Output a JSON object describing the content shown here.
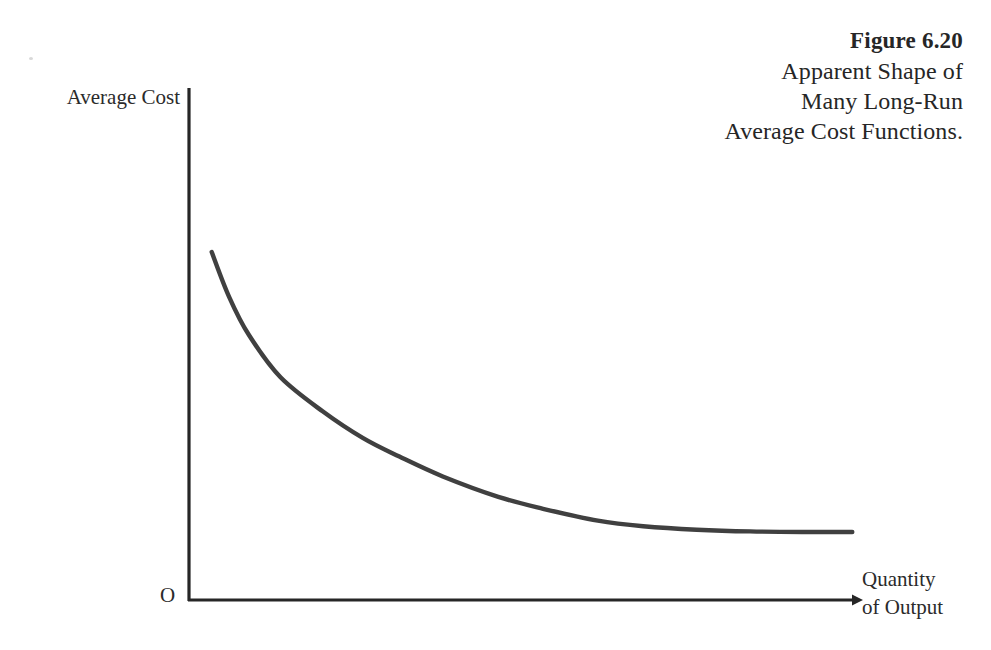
{
  "figure": {
    "caption_lines": [
      "Figure 6.20",
      "Apparent Shape of",
      "Many Long-Run",
      "Average Cost Functions."
    ],
    "caption_number": "Figure 6.20",
    "caption_line_2": "Apparent Shape of",
    "caption_line_3": "Many Long-Run",
    "caption_line_4": "Average Cost Functions.",
    "origin_label": "O",
    "y_axis_label": "Average Cost",
    "x_axis_label_line_1": "Quantity",
    "x_axis_label_line_2": "of Output"
  },
  "colors": {
    "background": "#ffffff",
    "curve": "#404040",
    "axis": "#262626",
    "text": "#2b2b2b"
  },
  "chart_data": {
    "type": "line",
    "title": "Apparent Shape of Many Long-Run Average Cost Functions.",
    "subtitle": "Figure 6.20",
    "xlabel": "Quantity of Output",
    "ylabel": "Average Cost",
    "grid": false,
    "legend": "none",
    "axis_style": "two-axis open (L-shaped), x-axis terminates in arrowhead",
    "origin_label": "O",
    "xlim": [
      0,
      100
    ],
    "ylim": [
      0,
      100
    ],
    "x_tick_labels": [],
    "y_tick_labels": [],
    "annotations": [],
    "series": [
      {
        "name": "Long-Run Average Cost",
        "description": "Monotonically decreasing convex curve that falls steeply at low output then flattens to a horizontal asymptote, illustrating economies of scale followed by constant returns.",
        "x": [
          3.4,
          6.0,
          9.0,
          13.7,
          20.0,
          26.0,
          31.5,
          38.0,
          46.3,
          53.0,
          61.2,
          68.0,
          76.0,
          84.0,
          92.0,
          99.3
        ],
        "y": [
          67.9,
          60.0,
          53.2,
          45.8,
          39.8,
          35.1,
          31.8,
          28.3,
          24.7,
          22.6,
          20.5,
          19.5,
          18.9,
          18.6,
          18.5,
          18.5
        ]
      }
    ]
  }
}
